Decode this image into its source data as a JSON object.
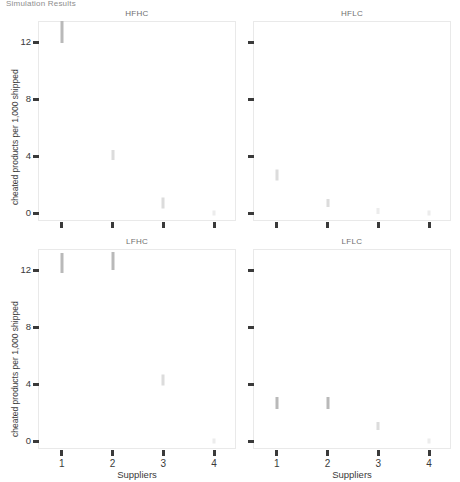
{
  "figure": {
    "supertitle": "Simulation Results",
    "y_axis_label": "cheated products per 1,000 shipped",
    "x_axis_label": "Suppliers"
  },
  "chart_data": {
    "type": "scatter",
    "title": "Simulation Results",
    "xlabel": "Suppliers",
    "ylabel": "cheated products per 1,000 shipped",
    "grid": false,
    "legend": "none",
    "xlim": [
      0.55,
      4.45
    ],
    "ylim": [
      -0.6,
      13.4
    ],
    "xticks": [
      "1",
      "2",
      "3",
      "4"
    ],
    "xtick_values": [
      1,
      2,
      3,
      4
    ],
    "yticks": [
      "0",
      "4",
      "8",
      "12"
    ],
    "ytick_values": [
      0,
      4,
      8,
      12
    ],
    "facet_layout": "2x2",
    "panels": [
      {
        "title": "HFHC",
        "row": 0,
        "col": 0,
        "x": [
          1,
          2,
          3,
          4
        ],
        "y": [
          12.7,
          4.1,
          0.7,
          0.05
        ],
        "marker_shape": "vertical-strip",
        "points": [
          {
            "x": 1,
            "y": 12.7,
            "height": 22,
            "shade": "normal"
          },
          {
            "x": 2,
            "y": 4.1,
            "height": 10,
            "shade": "faint"
          },
          {
            "x": 3,
            "y": 0.7,
            "height": 11,
            "shade": "faint"
          },
          {
            "x": 4,
            "y": 0.05,
            "height": 5,
            "shade": "vfaint"
          }
        ]
      },
      {
        "title": "HFLC",
        "row": 0,
        "col": 1,
        "x": [
          1,
          2,
          3,
          4
        ],
        "y": [
          2.7,
          0.75,
          0.2,
          0.05
        ],
        "marker_shape": "vertical-strip",
        "points": [
          {
            "x": 1,
            "y": 2.7,
            "height": 11,
            "shade": "faint"
          },
          {
            "x": 2,
            "y": 0.75,
            "height": 8,
            "shade": "faint"
          },
          {
            "x": 3,
            "y": 0.2,
            "height": 6,
            "shade": "vfaint"
          },
          {
            "x": 4,
            "y": 0.05,
            "height": 5,
            "shade": "vfaint"
          }
        ]
      },
      {
        "title": "LFHC",
        "row": 1,
        "col": 0,
        "x": [
          1,
          2,
          3,
          4
        ],
        "y": [
          12.5,
          12.6,
          4.3,
          0.05
        ],
        "marker_shape": "vertical-strip",
        "points": [
          {
            "x": 1,
            "y": 12.5,
            "height": 20,
            "shade": "normal"
          },
          {
            "x": 2,
            "y": 12.6,
            "height": 18,
            "shade": "normal"
          },
          {
            "x": 3,
            "y": 4.3,
            "height": 11,
            "shade": "faint"
          },
          {
            "x": 4,
            "y": 0.05,
            "height": 5,
            "shade": "vfaint"
          }
        ]
      },
      {
        "title": "LFLC",
        "row": 1,
        "col": 1,
        "x": [
          1,
          2,
          3,
          4
        ],
        "y": [
          2.7,
          2.7,
          1.1,
          0.05
        ],
        "marker_shape": "vertical-strip",
        "points": [
          {
            "x": 1,
            "y": 2.7,
            "height": 12,
            "shade": "normal"
          },
          {
            "x": 2,
            "y": 2.7,
            "height": 12,
            "shade": "normal"
          },
          {
            "x": 3,
            "y": 1.1,
            "height": 8,
            "shade": "faint"
          },
          {
            "x": 4,
            "y": 0.05,
            "height": 5,
            "shade": "vfaint"
          }
        ]
      }
    ]
  }
}
